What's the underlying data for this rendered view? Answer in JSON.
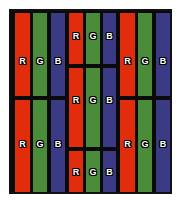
{
  "figure": {
    "background_color": "#ffffff",
    "frame_color": "#0a0a0a",
    "frame": {
      "x": 9,
      "y": 9,
      "width": 163,
      "height": 185
    },
    "gap_color": "#0a0a0a"
  },
  "colors": {
    "red": "#e22d0c",
    "green": "#4a8c3a",
    "blue": "#3b3b85",
    "label_text": "#ffffff",
    "label_outline": "#000000"
  },
  "legend": {
    "red_label": "R",
    "green_label": "G",
    "blue_label": "B"
  },
  "groups": [
    {
      "name": "left-group",
      "x": 4,
      "width": 50,
      "stripes": [
        {
          "name": "stripe-red",
          "channel": "R",
          "color_key": "red",
          "x": 0,
          "width": 15
        },
        {
          "name": "stripe-green",
          "channel": "G",
          "color_key": "green",
          "x": 18,
          "width": 14
        },
        {
          "name": "stripe-blue",
          "channel": "B",
          "color_key": "blue",
          "x": 36,
          "width": 14
        }
      ],
      "rows": [
        {
          "name": "row-top",
          "y": 2,
          "height": 83,
          "label_y": 50
        },
        {
          "name": "row-bottom",
          "y": 89,
          "height": 92,
          "label_y": 133
        }
      ]
    },
    {
      "name": "middle-group",
      "x": 58,
      "width": 47,
      "stripes": [
        {
          "name": "stripe-red",
          "channel": "R",
          "color_key": "red",
          "x": 0,
          "width": 14
        },
        {
          "name": "stripe-green",
          "channel": "G",
          "color_key": "green",
          "x": 17,
          "width": 14
        },
        {
          "name": "stripe-blue",
          "channel": "B",
          "color_key": "blue",
          "x": 34,
          "width": 13
        }
      ],
      "rows": [
        {
          "name": "row-top",
          "y": 2,
          "height": 51,
          "label_y": 25
        },
        {
          "name": "row-middle",
          "y": 57,
          "height": 79,
          "label_y": 89
        },
        {
          "name": "row-bottom",
          "y": 140,
          "height": 41,
          "label_y": 161
        }
      ]
    },
    {
      "name": "right-group",
      "x": 109,
      "width": 50,
      "stripes": [
        {
          "name": "stripe-red",
          "channel": "R",
          "color_key": "red",
          "x": 0,
          "width": 15
        },
        {
          "name": "stripe-green",
          "channel": "G",
          "color_key": "green",
          "x": 18,
          "width": 14
        },
        {
          "name": "stripe-blue",
          "channel": "B",
          "color_key": "blue",
          "x": 36,
          "width": 14
        }
      ],
      "rows": [
        {
          "name": "row-top",
          "y": 2,
          "height": 83,
          "label_y": 50
        },
        {
          "name": "row-bottom",
          "y": 89,
          "height": 92,
          "label_y": 133
        }
      ]
    }
  ]
}
